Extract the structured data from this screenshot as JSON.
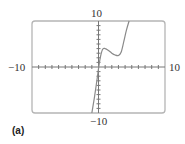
{
  "chart_data": {
    "type": "line",
    "title": "",
    "xlabel": "",
    "ylabel": "",
    "xlim": [
      -10,
      10
    ],
    "ylim": [
      -10,
      10
    ],
    "xtick_step": 1,
    "ytick_step": 1,
    "grid": false,
    "window_labels": {
      "xmin": "−10",
      "xmax": "10",
      "ymin": "−10",
      "ymax": "10"
    },
    "series": [
      {
        "name": "curve",
        "x": [
          -1.0,
          -0.6,
          -0.2,
          0.2,
          0.6,
          1.0,
          1.5,
          2.0,
          2.5,
          3.0,
          3.4,
          3.8,
          4.2,
          4.6
        ],
        "y": [
          -10,
          -6.5,
          -2.5,
          1.5,
          3.8,
          4.0,
          3.6,
          3.0,
          2.6,
          2.5,
          3.2,
          5.5,
          8.0,
          10
        ]
      }
    ],
    "color": "#8a8a8a"
  },
  "caption": "(a)"
}
